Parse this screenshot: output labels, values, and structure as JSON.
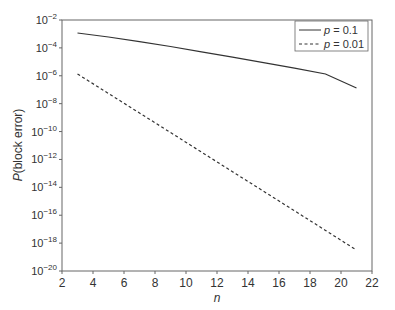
{
  "chart_data": {
    "type": "line",
    "title": "",
    "xlabel": "n",
    "ylabel": "P(block error)",
    "xlim": [
      2,
      22
    ],
    "ylim": [
      1e-20,
      0.01
    ],
    "yscale": "log",
    "grid": false,
    "legend_position": "upper right",
    "x_ticks": [
      2,
      4,
      6,
      8,
      10,
      12,
      14,
      16,
      18,
      20,
      22
    ],
    "y_ticks_exp": [
      -2,
      -4,
      -6,
      -8,
      -10,
      -12,
      -14,
      -16,
      -18,
      -20
    ],
    "x": [
      3,
      5,
      7,
      9,
      11,
      13,
      15,
      17,
      19,
      21
    ],
    "series": [
      {
        "name": "p = 0.1",
        "label_var": "p",
        "label_val": " = 0.1",
        "style": "solid",
        "log10_values": [
          -2.93,
          -3.22,
          -3.55,
          -3.9,
          -4.28,
          -4.66,
          -5.06,
          -5.46,
          -5.87,
          -6.88
        ],
        "values": [
          0.0012,
          0.0006,
          0.00028,
          0.00013,
          5.2e-05,
          2.2e-05,
          8.7e-06,
          3.5e-06,
          1.3e-06,
          1.3e-07
        ]
      },
      {
        "name": "p = 0.01",
        "label_var": "p",
        "label_val": " = 0.01",
        "style": "dashed",
        "log10_values": [
          -5.87,
          -7.27,
          -8.67,
          -10.07,
          -11.47,
          -12.88,
          -14.28,
          -15.68,
          -17.09,
          -18.5
        ],
        "values": [
          1.3e-06,
          5.4e-08,
          2.1e-09,
          8.5e-11,
          3.4e-12,
          1.3e-13,
          5.2e-15,
          2.1e-16,
          8.1e-18,
          3.2e-19
        ]
      }
    ]
  },
  "axes": {
    "xlabel": "n",
    "ylabel_var": "P",
    "ylabel_rest": "(block error)"
  }
}
